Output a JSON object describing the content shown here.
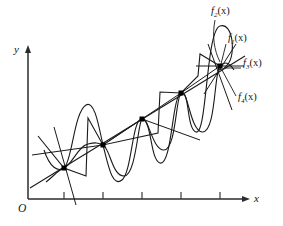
{
  "figure": {
    "type": "math-function-plot",
    "axes": {
      "x_label": "x",
      "y_label": "y",
      "origin_label": "O",
      "x_axis": {
        "x_start": 28,
        "x_end": 248,
        "y": 199,
        "arrow": true
      },
      "y_axis": {
        "x": 28,
        "y_start": 199,
        "y_end": 47,
        "arrow": true
      },
      "x_ticks": [
        64,
        103,
        142,
        181,
        220
      ],
      "tick_length": 6,
      "grid": false
    },
    "nodes": [
      {
        "index": 1,
        "x": 64,
        "y": 168
      },
      {
        "index": 2,
        "x": 103,
        "y": 145
      },
      {
        "index": 3,
        "x": 142,
        "y": 119
      },
      {
        "index": 4,
        "x": 181,
        "y": 93
      },
      {
        "index": 5,
        "x": 220,
        "y": 66
      }
    ],
    "node_marker": "filled-square",
    "node_marker_size": 4,
    "curves": [
      {
        "name": "f1",
        "style": "straight-line",
        "description": "rising straight line through all nodes"
      },
      {
        "name": "f2",
        "style": "large-oscillation",
        "description": "high amplitude oscillating curve through all nodes"
      },
      {
        "name": "f3",
        "style": "piecewise-linear",
        "description": "zigzag step polyline through all nodes"
      },
      {
        "name": "f4",
        "style": "small-oscillation",
        "description": "lower amplitude oscillating curve through all nodes"
      }
    ],
    "labels": [
      {
        "id": "f2",
        "base": "f",
        "sub": "2",
        "arg": "(x)",
        "x": 211,
        "y": 10,
        "leader_to_node": 5
      },
      {
        "id": "f1",
        "base": "f",
        "sub": "1",
        "arg": "(x)",
        "x": 228,
        "y": 38,
        "leader_to_node": 5
      },
      {
        "id": "f3",
        "base": "f",
        "sub": "3",
        "arg": "(x)",
        "x": 243,
        "y": 63,
        "leader_to_node": 5
      },
      {
        "id": "f4",
        "base": "f",
        "sub": "4",
        "arg": "(x)",
        "x": 238,
        "y": 97,
        "leader_to_node": 5
      }
    ],
    "colors": {
      "stroke": "#1a1a1a",
      "axis": "#2b2b2b",
      "background": "#ffffff",
      "marker": "#000000"
    }
  }
}
